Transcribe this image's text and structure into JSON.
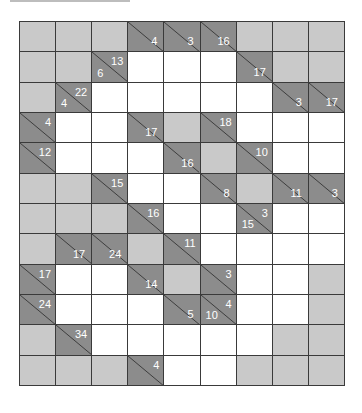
{
  "puzzle": {
    "type": "kakuro",
    "rows": 12,
    "cols": 9,
    "colors": {
      "blocked": "#c9c9c9",
      "clue": "#8c8c8c",
      "white": "#ffffff",
      "grid_line": "#3a3a3a",
      "clue_text": "#ffffff"
    },
    "cells": [
      [
        {
          "t": "b"
        },
        {
          "t": "b"
        },
        {
          "t": "b"
        },
        {
          "t": "c",
          "down": "4"
        },
        {
          "t": "c",
          "down": "3"
        },
        {
          "t": "c",
          "down": "16"
        },
        {
          "t": "b"
        },
        {
          "t": "b"
        },
        {
          "t": "b"
        }
      ],
      [
        {
          "t": "b"
        },
        {
          "t": "b"
        },
        {
          "t": "c",
          "across": "13",
          "down": "6"
        },
        {
          "t": "w"
        },
        {
          "t": "w"
        },
        {
          "t": "w"
        },
        {
          "t": "c",
          "down": "17"
        },
        {
          "t": "b"
        },
        {
          "t": "b"
        }
      ],
      [
        {
          "t": "b"
        },
        {
          "t": "c",
          "across": "22",
          "down": "4"
        },
        {
          "t": "w"
        },
        {
          "t": "w"
        },
        {
          "t": "w"
        },
        {
          "t": "w"
        },
        {
          "t": "w"
        },
        {
          "t": "c",
          "down": "3"
        },
        {
          "t": "c",
          "down": "17"
        }
      ],
      [
        {
          "t": "c",
          "across": "4"
        },
        {
          "t": "w"
        },
        {
          "t": "w"
        },
        {
          "t": "c",
          "down": "17"
        },
        {
          "t": "b"
        },
        {
          "t": "c",
          "across": "18"
        },
        {
          "t": "w"
        },
        {
          "t": "w"
        },
        {
          "t": "w"
        }
      ],
      [
        {
          "t": "c",
          "across": "12"
        },
        {
          "t": "w"
        },
        {
          "t": "w"
        },
        {
          "t": "w"
        },
        {
          "t": "c",
          "down": "16"
        },
        {
          "t": "b"
        },
        {
          "t": "c",
          "across": "10"
        },
        {
          "t": "w"
        },
        {
          "t": "w"
        }
      ],
      [
        {
          "t": "b"
        },
        {
          "t": "b"
        },
        {
          "t": "c",
          "across": "15"
        },
        {
          "t": "w"
        },
        {
          "t": "w"
        },
        {
          "t": "c",
          "down": "8"
        },
        {
          "t": "b"
        },
        {
          "t": "c",
          "down": "11"
        },
        {
          "t": "c",
          "down": "3"
        }
      ],
      [
        {
          "t": "b"
        },
        {
          "t": "b"
        },
        {
          "t": "b"
        },
        {
          "t": "c",
          "across": "16"
        },
        {
          "t": "w"
        },
        {
          "t": "w"
        },
        {
          "t": "c",
          "across": "3",
          "down": "15"
        },
        {
          "t": "w"
        },
        {
          "t": "w"
        }
      ],
      [
        {
          "t": "b"
        },
        {
          "t": "c",
          "down": "17"
        },
        {
          "t": "c",
          "down": "24"
        },
        {
          "t": "b"
        },
        {
          "t": "c",
          "across": "11"
        },
        {
          "t": "w"
        },
        {
          "t": "w"
        },
        {
          "t": "w"
        },
        {
          "t": "w"
        }
      ],
      [
        {
          "t": "c",
          "across": "17"
        },
        {
          "t": "w"
        },
        {
          "t": "w"
        },
        {
          "t": "c",
          "down": "14"
        },
        {
          "t": "b"
        },
        {
          "t": "c",
          "across": "3"
        },
        {
          "t": "w"
        },
        {
          "t": "w"
        },
        {
          "t": "b"
        }
      ],
      [
        {
          "t": "c",
          "across": "24"
        },
        {
          "t": "w"
        },
        {
          "t": "w"
        },
        {
          "t": "w"
        },
        {
          "t": "c",
          "down": "5"
        },
        {
          "t": "c",
          "across": "4",
          "down": "10"
        },
        {
          "t": "w"
        },
        {
          "t": "w"
        },
        {
          "t": "b"
        }
      ],
      [
        {
          "t": "b"
        },
        {
          "t": "c",
          "across": "34"
        },
        {
          "t": "w"
        },
        {
          "t": "w"
        },
        {
          "t": "w"
        },
        {
          "t": "w"
        },
        {
          "t": "w"
        },
        {
          "t": "b"
        },
        {
          "t": "b"
        }
      ],
      [
        {
          "t": "b"
        },
        {
          "t": "b"
        },
        {
          "t": "b"
        },
        {
          "t": "c",
          "across": "4"
        },
        {
          "t": "w"
        },
        {
          "t": "w"
        },
        {
          "t": "b"
        },
        {
          "t": "b"
        },
        {
          "t": "b"
        }
      ]
    ]
  }
}
